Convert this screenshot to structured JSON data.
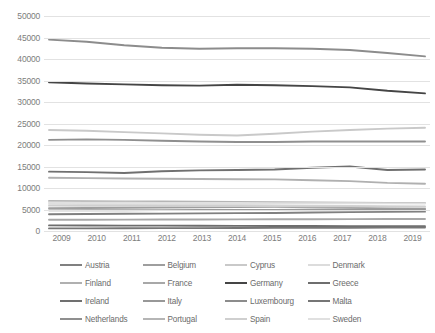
{
  "chart_data": {
    "type": "line",
    "title": "",
    "subtitle": "",
    "xlabel": "",
    "ylabel": "",
    "x": [
      2009,
      2010,
      2011,
      2012,
      2013,
      2014,
      2015,
      2016,
      2017,
      2018,
      2019
    ],
    "xtick_labels": [
      "2009",
      "2010",
      "2011",
      "2012",
      "2013",
      "2014",
      "2015",
      "2016",
      "2017",
      "2018",
      "2019"
    ],
    "ylim": [
      0,
      50000
    ],
    "ytick_values": [
      0,
      5000,
      10000,
      15000,
      20000,
      25000,
      30000,
      35000,
      40000,
      45000,
      50000
    ],
    "ytick_labels": [
      "0",
      "5000",
      "10000",
      "15000",
      "20000",
      "25000",
      "30000",
      "35000",
      "40000",
      "45000",
      "50000"
    ],
    "grid": true,
    "legend_position": "bottom",
    "legend_columns": 4,
    "series": [
      {
        "name": "Austria",
        "color": "#808080",
        "values": [
          3900,
          3950,
          4000,
          4050,
          4100,
          4150,
          4200,
          4300,
          4400,
          4450,
          4500
        ]
      },
      {
        "name": "Belgium",
        "color": "#9e9e9e",
        "values": [
          5300,
          5350,
          5400,
          5450,
          5500,
          5550,
          5600,
          5500,
          5400,
          5300,
          5200
        ]
      },
      {
        "name": "Cyprus",
        "color": "#c9c9c9",
        "values": [
          23500,
          23300,
          23000,
          22700,
          22400,
          22200,
          22600,
          23100,
          23500,
          23800,
          24000
        ]
      },
      {
        "name": "Denmark",
        "color": "#dcdcdc",
        "values": [
          6300,
          6250,
          6200,
          6150,
          6100,
          6050,
          6000,
          5900,
          5800,
          5700,
          5600
        ]
      },
      {
        "name": "Finland",
        "color": "#b0b0b0",
        "values": [
          12400,
          12300,
          12200,
          12150,
          12100,
          12050,
          12000,
          11800,
          11600,
          11200,
          11000
        ]
      },
      {
        "name": "France",
        "color": "#a8a8a8",
        "values": [
          2600,
          2620,
          2640,
          2660,
          2680,
          2700,
          2720,
          2740,
          2760,
          2780,
          2800
        ]
      },
      {
        "name": "Germany",
        "color": "#454545",
        "values": [
          34600,
          34300,
          34100,
          33900,
          33800,
          34000,
          33900,
          33700,
          33400,
          32600,
          32000
        ]
      },
      {
        "name": "Greece",
        "color": "#6e6e6e",
        "values": [
          1300,
          1280,
          1260,
          1240,
          1220,
          1200,
          1180,
          1160,
          1140,
          1120,
          1100
        ]
      },
      {
        "name": "Ireland",
        "color": "#707070",
        "values": [
          13800,
          13700,
          13500,
          13900,
          14100,
          14200,
          14300,
          14700,
          15000,
          14200,
          14300
        ]
      },
      {
        "name": "Italy",
        "color": "#989898",
        "values": [
          4800,
          4820,
          4840,
          4860,
          4880,
          4900,
          4920,
          4940,
          4960,
          4980,
          5000
        ]
      },
      {
        "name": "Luxembourg",
        "color": "#8c8c8c",
        "values": [
          44500,
          44000,
          43200,
          42600,
          42400,
          42500,
          42500,
          42400,
          42100,
          41400,
          40600
        ]
      },
      {
        "name": "Malta",
        "color": "#767676",
        "values": [
          600,
          620,
          640,
          660,
          680,
          700,
          720,
          740,
          760,
          780,
          800
        ]
      },
      {
        "name": "Netherlands",
        "color": "#8f8f8f",
        "values": [
          21200,
          21300,
          21200,
          21000,
          20800,
          20700,
          20700,
          20800,
          20800,
          20800,
          20800
        ]
      },
      {
        "name": "Portugal",
        "color": "#b5b5b5",
        "values": [
          7000,
          6950,
          6900,
          6850,
          6800,
          6750,
          6700,
          6650,
          6600,
          6550,
          6500
        ]
      },
      {
        "name": "Spain",
        "color": "#cfcfcf",
        "values": [
          5900,
          5880,
          5860,
          5840,
          5820,
          5800,
          5780,
          5760,
          5740,
          5720,
          5700
        ]
      },
      {
        "name": "Sweden",
        "color": "#e0e0e0",
        "values": [
          6600,
          6580,
          6560,
          6540,
          6520,
          6500,
          6480,
          6460,
          6440,
          6420,
          6400
        ]
      }
    ]
  }
}
